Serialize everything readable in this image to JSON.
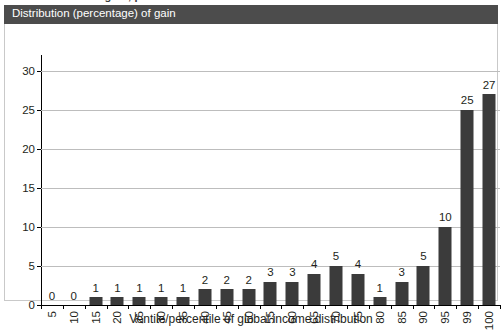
{
  "top_fragment": "distribution of the gain, percent",
  "panel": {
    "title": "Distribution (percentage) of gain"
  },
  "chart_data": {
    "type": "bar",
    "title": "Distribution (percentage) of gain",
    "xlabel": "Ventile/percentile of global income distribution",
    "ylabel": "",
    "categories": [
      "5",
      "10",
      "15",
      "20",
      "25",
      "30",
      "35",
      "40",
      "45",
      "50",
      "55",
      "60",
      "65",
      "70",
      "75",
      "80",
      "85",
      "90",
      "95",
      "99",
      "100"
    ],
    "values": [
      0,
      0,
      1,
      1,
      1,
      1,
      1,
      2,
      2,
      2,
      3,
      3,
      4,
      5,
      4,
      1,
      3,
      5,
      10,
      25,
      27
    ],
    "ylim": [
      0,
      32
    ],
    "yticks": [
      0,
      5,
      10,
      15,
      20,
      25,
      30
    ],
    "grid": true,
    "legend": false,
    "bar_color": "#3b3b3b",
    "gridline_color": "#bdbdbd",
    "axis_color": "#000000"
  }
}
